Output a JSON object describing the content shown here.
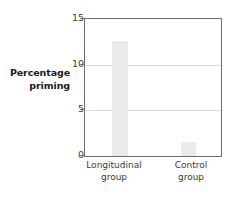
{
  "chart_data": {
    "type": "bar",
    "title": "",
    "xlabel": "",
    "ylabel": "Percentage priming",
    "ylabel_lines": [
      "Percentage",
      "priming"
    ],
    "categories": [
      "Longitudinal group",
      "Control group"
    ],
    "category_lines": [
      [
        "Longitudinal",
        "group"
      ],
      [
        "Control",
        "group"
      ]
    ],
    "values": [
      12.6,
      1.5
    ],
    "ylim": [
      0,
      15
    ],
    "yticks": [
      0,
      5,
      10,
      15
    ],
    "ytick_labels": [
      "0",
      "5",
      "10",
      "15"
    ],
    "grid": true,
    "grid_axis": "y",
    "gridlines_at": [
      5,
      10
    ],
    "legend": null,
    "legend_position": "none",
    "bar_color": "#ebebeb",
    "axis_color": "#6e6e6e",
    "grid_color": "#dcdcdc",
    "text_color": "#3a3a3a",
    "background": "#ffffff"
  }
}
